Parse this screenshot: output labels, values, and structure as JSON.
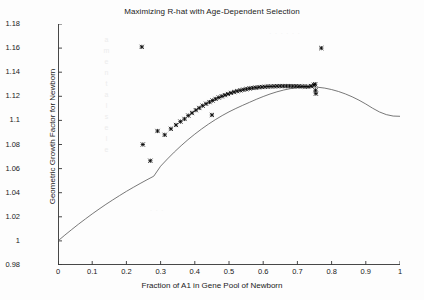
{
  "chart_data": {
    "type": "scatter",
    "title": "Maximizing R-hat with Age-Dependent Selection",
    "xlabel": "Fraction of A1 in Gene Pool of Newborn",
    "ylabel": "Geometric Growth Factor for Newborn",
    "xlim": [
      0,
      1
    ],
    "ylim": [
      0.98,
      1.18
    ],
    "xticks": [
      "0",
      "0.1",
      "0.2",
      "0.3",
      "0.4",
      "0.5",
      "0.6",
      "0.7",
      "0.8",
      "0.9",
      "1"
    ],
    "xtick_values": [
      0,
      0.1,
      0.2,
      0.3,
      0.4,
      0.5,
      0.6,
      0.7,
      0.8,
      0.9,
      1
    ],
    "yticks": [
      "0.98",
      "1",
      "1.02",
      "1.04",
      "1.06",
      "1.08",
      "1.1",
      "1.12",
      "1.14",
      "1.16",
      "1.18"
    ],
    "ytick_values": [
      0.98,
      1.0,
      1.02,
      1.04,
      1.06,
      1.08,
      1.1,
      1.12,
      1.14,
      1.16,
      1.18
    ],
    "grid": false,
    "legend": "none",
    "box": false,
    "series": [
      {
        "name": "Growth factor curve",
        "type": "line",
        "color": "#555555",
        "x": [
          0.0,
          0.02,
          0.04,
          0.06,
          0.08,
          0.1,
          0.12,
          0.14,
          0.16,
          0.18,
          0.2,
          0.22,
          0.24,
          0.26,
          0.28,
          0.3,
          0.32,
          0.34,
          0.36,
          0.38,
          0.4,
          0.42,
          0.44,
          0.46,
          0.48,
          0.5,
          0.52,
          0.54,
          0.56,
          0.58,
          0.6,
          0.62,
          0.64,
          0.66,
          0.68,
          0.7,
          0.72,
          0.74,
          0.76,
          0.78,
          0.8,
          0.82,
          0.84,
          0.86,
          0.88,
          0.9,
          0.92,
          0.94,
          0.96,
          0.98,
          1.0
        ],
        "y": [
          1.0,
          1.0048,
          1.0094,
          1.0139,
          1.0182,
          1.0224,
          1.0264,
          1.0303,
          1.034,
          1.0376,
          1.0411,
          1.0444,
          1.0476,
          1.0507,
          1.0537,
          1.062,
          1.068,
          1.0737,
          1.079,
          1.084,
          1.0886,
          1.0929,
          1.0969,
          1.1006,
          1.104,
          1.1071,
          1.1099,
          1.1125,
          1.115,
          1.1175,
          1.1198,
          1.1219,
          1.1237,
          1.1252,
          1.1264,
          1.1272,
          1.1277,
          1.1278,
          1.1275,
          1.1268,
          1.1256,
          1.124,
          1.122,
          1.1196,
          1.1168,
          1.1136,
          1.1101,
          1.107,
          1.1048,
          1.1036,
          1.1034
        ]
      },
      {
        "name": "Simulation samples",
        "type": "scatter",
        "marker": "x-star",
        "color": "#000000",
        "points": [
          [
            0.245,
            1.161
          ],
          [
            0.77,
            1.16
          ],
          [
            0.248,
            1.08
          ],
          [
            0.27,
            1.0665
          ],
          [
            0.291,
            1.0912
          ],
          [
            0.312,
            1.088
          ],
          [
            0.33,
            1.093
          ],
          [
            0.345,
            1.0962
          ],
          [
            0.358,
            1.099
          ],
          [
            0.37,
            1.1012
          ],
          [
            0.381,
            1.104
          ],
          [
            0.392,
            1.1062
          ],
          [
            0.403,
            1.1085
          ],
          [
            0.413,
            1.1103
          ],
          [
            0.423,
            1.1122
          ],
          [
            0.433,
            1.1138
          ],
          [
            0.443,
            1.1152
          ],
          [
            0.452,
            1.1165
          ],
          [
            0.45,
            1.1045
          ],
          [
            0.461,
            1.1178
          ],
          [
            0.47,
            1.119
          ],
          [
            0.479,
            1.12
          ],
          [
            0.488,
            1.121
          ],
          [
            0.497,
            1.1219
          ],
          [
            0.506,
            1.1228
          ],
          [
            0.515,
            1.1236
          ],
          [
            0.524,
            1.1243
          ],
          [
            0.533,
            1.1249
          ],
          [
            0.542,
            1.1255
          ],
          [
            0.551,
            1.126
          ],
          [
            0.56,
            1.1265
          ],
          [
            0.569,
            1.1269
          ],
          [
            0.578,
            1.1272
          ],
          [
            0.587,
            1.1275
          ],
          [
            0.596,
            1.1277
          ],
          [
            0.605,
            1.1279
          ],
          [
            0.614,
            1.1281
          ],
          [
            0.623,
            1.1282
          ],
          [
            0.632,
            1.1283
          ],
          [
            0.641,
            1.1284
          ],
          [
            0.65,
            1.1285
          ],
          [
            0.659,
            1.1285
          ],
          [
            0.668,
            1.1285
          ],
          [
            0.677,
            1.1285
          ],
          [
            0.686,
            1.1284
          ],
          [
            0.695,
            1.1284
          ],
          [
            0.704,
            1.1283
          ],
          [
            0.713,
            1.1282
          ],
          [
            0.722,
            1.1281
          ],
          [
            0.731,
            1.128
          ],
          [
            0.74,
            1.1285
          ],
          [
            0.748,
            1.1295
          ],
          [
            0.752,
            1.13
          ],
          [
            0.753,
            1.125
          ],
          [
            0.754,
            1.1222
          ]
        ]
      }
    ]
  },
  "ghosts": {
    "column": "a\nm\ne\nn\nt\na\nl\ns\ne",
    "top": "",
    "bottomleft": ""
  }
}
